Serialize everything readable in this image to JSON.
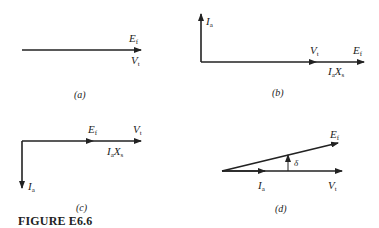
{
  "figure_title": "FIGURE E6.6",
  "panels": {
    "a": {
      "caption": "(a)",
      "labels": {
        "ef_main": "E",
        "ef_sub": "f",
        "vt_main": "V",
        "vt_sub": "t"
      }
    },
    "b": {
      "caption": "(b)",
      "labels": {
        "ia_main": "I",
        "ia_sub": "a",
        "vt_main": "V",
        "vt_sub": "t",
        "ef_main": "E",
        "ef_sub": "f",
        "iaxs_i": "I",
        "iaxs_a": "a",
        "iaxs_x": "X",
        "iaxs_s": "s"
      }
    },
    "c": {
      "caption": "(c)",
      "labels": {
        "ef_main": "E",
        "ef_sub": "f",
        "vt_main": "V",
        "vt_sub": "t",
        "iaxs_i": "I",
        "iaxs_a": "a",
        "iaxs_x": "X",
        "iaxs_s": "s",
        "ia_main": "I",
        "ia_sub": "a"
      }
    },
    "d": {
      "caption": "(d)",
      "labels": {
        "ef_main": "E",
        "ef_sub": "f",
        "delta": "δ",
        "ia_main": "I",
        "ia_sub": "a",
        "vt_main": "V",
        "vt_sub": "t"
      }
    }
  },
  "colors": {
    "stroke": "#222222",
    "background": "#ffffff"
  }
}
